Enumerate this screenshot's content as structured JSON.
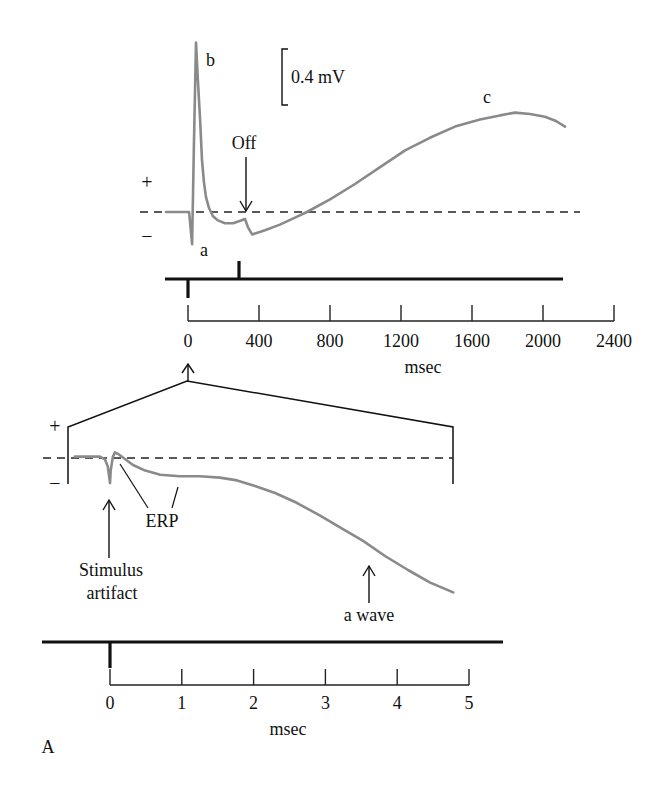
{
  "figure": {
    "panel_label": "A",
    "top": {
      "plus": "+",
      "minus": "−",
      "scale_bar_label": "0.4 mV",
      "wave_a_label": "a",
      "wave_b_label": "b",
      "wave_c_label": "c",
      "off_label": "Off",
      "x_unit": "msec"
    },
    "bottom": {
      "plus": "+",
      "minus": "−",
      "erp_label": "ERP",
      "stimulus_label_line1": "Stimulus",
      "stimulus_label_line2": "artifact",
      "a_wave_label": "a wave",
      "x_unit": "msec"
    }
  },
  "colors": {
    "trace": "#8a8a8a",
    "ink": "#111111"
  },
  "chart_data": [
    {
      "type": "line",
      "title": "",
      "xlabel": "msec",
      "ylabel": "",
      "xlim": [
        0,
        2400
      ],
      "xticks": [
        0,
        400,
        800,
        1200,
        1600,
        2000,
        2400
      ],
      "xtick_labels": [
        "0",
        "400",
        "800",
        "1200",
        "1600",
        "2000",
        "2400"
      ],
      "baseline": 0,
      "grid": false,
      "scale_bar": {
        "value": 0.4,
        "unit": "mV"
      },
      "stimulus": {
        "on_ms": 0,
        "off_ms": 290
      },
      "annotations": [
        {
          "text": "a",
          "x": 23,
          "y": -0.23
        },
        {
          "text": "b",
          "x": 45,
          "y": 1.21
        },
        {
          "text": "c",
          "x": 1842,
          "y": 0.71
        },
        {
          "text": "Off",
          "x": 321,
          "y": 0
        }
      ],
      "series": [
        {
          "name": "ERG response (mV)",
          "x": [
            -124,
            6,
            23,
            34,
            45,
            56,
            68,
            79,
            90,
            101,
            118,
            141,
            169,
            208,
            254,
            299,
            321,
            338,
            361,
            434,
            518,
            603,
            670,
            800,
            941,
            1082,
            1223,
            1363,
            1504,
            1645,
            1758,
            1842,
            1927,
            2011,
            2073,
            2124
          ],
          "y": [
            0,
            0,
            -0.23,
            0.51,
            1.21,
            0.94,
            0.66,
            0.37,
            0.21,
            0.11,
            0.03,
            -0.03,
            -0.06,
            -0.08,
            -0.08,
            -0.06,
            -0.05,
            -0.11,
            -0.16,
            -0.13,
            -0.09,
            -0.04,
            0,
            0.09,
            0.2,
            0.32,
            0.44,
            0.53,
            0.61,
            0.66,
            0.69,
            0.71,
            0.7,
            0.68,
            0.65,
            0.61
          ]
        }
      ]
    },
    {
      "type": "line",
      "title": "",
      "xlabel": "msec",
      "ylabel": "",
      "xlim": [
        0,
        5
      ],
      "xticks": [
        0,
        1,
        2,
        3,
        4,
        5
      ],
      "xtick_labels": [
        "0",
        "1",
        "2",
        "3",
        "4",
        "5"
      ],
      "baseline": 0,
      "grid": false,
      "stimulus": {
        "on_ms": 0
      },
      "annotations": [
        {
          "text": "Stimulus artifact",
          "x": 0
        },
        {
          "text": "ERP",
          "x": 0.5
        },
        {
          "text": "a wave",
          "x": 3.6
        }
      ],
      "series": [
        {
          "name": "ERG onset, expanded (relative mV)",
          "x": [
            -0.49,
            -0.14,
            -0.07,
            -0.03,
            0,
            0.01,
            0.04,
            0.07,
            0.11,
            0.19,
            0.32,
            0.49,
            0.7,
            0.97,
            1.25,
            1.53,
            1.77,
            2.02,
            2.3,
            2.6,
            2.92,
            3.25,
            3.52,
            3.83,
            4.15,
            4.46,
            4.78
          ],
          "y": [
            0.01,
            0.01,
            -0.01,
            -0.06,
            -0.18,
            -0.09,
            0.01,
            0.04,
            0.03,
            0,
            -0.05,
            -0.09,
            -0.12,
            -0.13,
            -0.13,
            -0.14,
            -0.16,
            -0.2,
            -0.25,
            -0.32,
            -0.41,
            -0.51,
            -0.59,
            -0.7,
            -0.8,
            -0.89,
            -0.96
          ]
        }
      ]
    }
  ]
}
